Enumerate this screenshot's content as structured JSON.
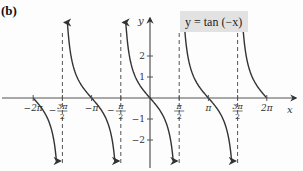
{
  "chart_data": {
    "type": "line",
    "title": "",
    "part_label": "(b)",
    "equation_label": "y = tan (−x)",
    "function": "y = tan(-x)",
    "xlabel": "x",
    "ylabel": "y",
    "xlim": [
      -6.6,
      7.1
    ],
    "ylim": [
      -3.0,
      3.6
    ],
    "x_ticks": [
      {
        "value": -6.2832,
        "label": "−2π"
      },
      {
        "value": -4.7124,
        "label": "−3π/2"
      },
      {
        "value": -3.1416,
        "label": "−π"
      },
      {
        "value": -1.5708,
        "label": "−π/2"
      },
      {
        "value": 1.5708,
        "label": "π/2"
      },
      {
        "value": 3.1416,
        "label": "π"
      },
      {
        "value": 4.7124,
        "label": "3π/2"
      },
      {
        "value": 6.2832,
        "label": "2π"
      }
    ],
    "y_ticks": [
      {
        "value": 2,
        "label": "2"
      },
      {
        "value": 1,
        "label": "1"
      },
      {
        "value": -1,
        "label": "−1"
      },
      {
        "value": -2,
        "label": "−2"
      }
    ],
    "asymptotes": [
      -4.7124,
      -1.5708,
      1.5708,
      4.7124
    ],
    "branches": [
      {
        "x_start": -6.2832,
        "x_end": -4.83,
        "description": "from (−2π, 0) down toward −∞ at −3π/2"
      },
      {
        "x_start": -4.59,
        "x_end": -1.69,
        "description": "from +∞ at −3π/2 through (−π, 0) to −∞ at −π/2"
      },
      {
        "x_start": -1.45,
        "x_end": 1.45,
        "description": "from +∞ at −π/2 through (0, 0) to −∞ at π/2"
      },
      {
        "x_start": 1.69,
        "x_end": 4.59,
        "description": "from +∞ at π/2 through (π, 0) to −∞ at 3π/2"
      },
      {
        "x_start": 4.83,
        "x_end": 6.2832,
        "description": "from +∞ at 3π/2 down to (2π, 0)"
      }
    ],
    "grid": false,
    "legend": "none"
  },
  "labels": {
    "part": "(b)",
    "equation": "y = tan (−x)",
    "x_axis": "x",
    "y_axis": "y"
  },
  "colors": {
    "curve": "#333333",
    "axis": "#555555",
    "asymptote": "#555555",
    "equation_box": "#e2e2e2"
  }
}
